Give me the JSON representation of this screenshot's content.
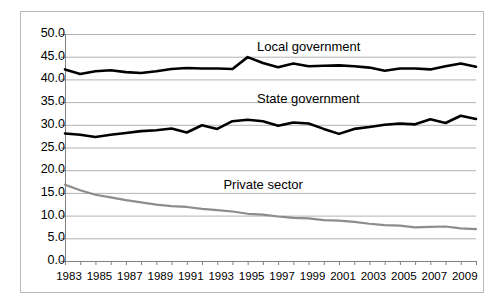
{
  "top_clipped_text": "· ·· ···· ···· ···· ······ · ···· ··· ···· ····",
  "colors": {
    "dark_series": "#000000",
    "gray_series": "#8c8c8c",
    "gridline": "#b3b3b3",
    "axis": "#808080",
    "frame": "#b9b9b9",
    "background": "#ffffff"
  },
  "chart_data": {
    "type": "line",
    "title": "",
    "subtitle": "",
    "xlabel": "",
    "ylabel": "",
    "xlim": [
      1983,
      2010
    ],
    "ylim": [
      0.0,
      50.0
    ],
    "ytick_step": 5.0,
    "grid": true,
    "legend_position": "inline-annotation",
    "ytick_labels": [
      "50.0",
      "45.0",
      "40.0",
      "35.0",
      "30.0",
      "25.0",
      "20.0",
      "15.0",
      "10.0",
      "5.0",
      "0.0"
    ],
    "ytick_values": [
      50.0,
      45.0,
      40.0,
      35.0,
      30.0,
      25.0,
      20.0,
      15.0,
      10.0,
      5.0,
      0.0
    ],
    "xtick_labels": [
      "1983",
      "1985",
      "1987",
      "1989",
      "1991",
      "1993",
      "1995",
      "1997",
      "1999",
      "2001",
      "2003",
      "2005",
      "2007",
      "2009"
    ],
    "xtick_values": [
      1983,
      1985,
      1987,
      1989,
      1991,
      1993,
      1995,
      1997,
      1999,
      2001,
      2003,
      2005,
      2007,
      2009
    ],
    "x": [
      1983,
      1984,
      1985,
      1986,
      1987,
      1988,
      1989,
      1990,
      1991,
      1992,
      1993,
      1994,
      1995,
      1996,
      1997,
      1998,
      1999,
      2000,
      2001,
      2002,
      2003,
      2004,
      2005,
      2006,
      2007,
      2008,
      2009,
      2010
    ],
    "series": [
      {
        "name": "Local government",
        "color": "#000000",
        "values": [
          42.2,
          41.2,
          41.8,
          42.0,
          41.6,
          41.4,
          41.8,
          42.3,
          42.5,
          42.4,
          42.4,
          42.3,
          44.9,
          43.6,
          42.7,
          43.5,
          42.9,
          43.0,
          43.1,
          42.9,
          42.6,
          41.9,
          42.4,
          42.4,
          42.2,
          42.9,
          43.5,
          42.8
        ]
      },
      {
        "name": "State government",
        "color": "#000000",
        "values": [
          28.1,
          27.8,
          27.3,
          27.8,
          28.2,
          28.6,
          28.8,
          29.2,
          28.3,
          29.9,
          29.1,
          30.8,
          31.1,
          30.8,
          29.8,
          30.5,
          30.3,
          29.1,
          28.0,
          29.1,
          29.5,
          30.0,
          30.3,
          30.1,
          31.2,
          30.4,
          32.0,
          31.3
        ]
      },
      {
        "name": "Private sector",
        "color": "#8c8c8c",
        "values": [
          16.8,
          15.6,
          14.6,
          14.0,
          13.4,
          12.9,
          12.4,
          12.1,
          11.9,
          11.5,
          11.2,
          10.9,
          10.4,
          10.2,
          9.8,
          9.5,
          9.4,
          9.0,
          8.9,
          8.6,
          8.2,
          7.9,
          7.8,
          7.4,
          7.5,
          7.6,
          7.2,
          7.0
        ]
      }
    ],
    "annotations": [
      {
        "text": "Local government",
        "x": 1999,
        "y": 47.0
      },
      {
        "text": "State government",
        "x": 1999,
        "y": 35.5
      },
      {
        "text": "Private sector",
        "x": 1996,
        "y": 16.5
      }
    ]
  }
}
